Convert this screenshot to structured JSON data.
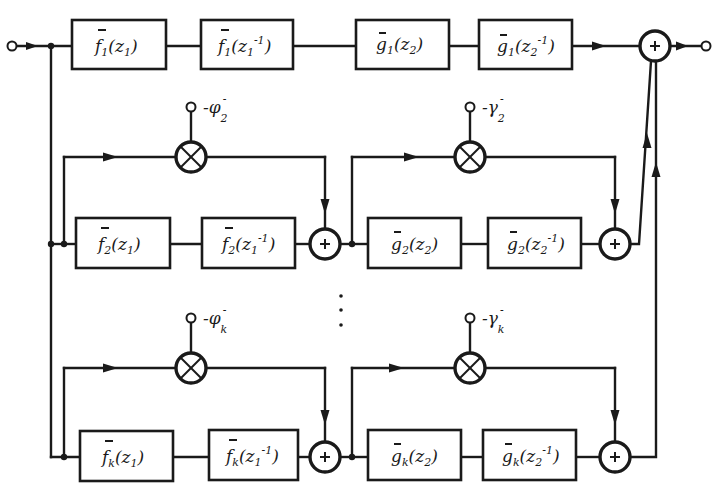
{
  "diagram": {
    "type": "block-diagram",
    "colors": {
      "ink": "#1a1a1a",
      "background": "#ffffff"
    },
    "input": {
      "label": ""
    },
    "output": {
      "label": ""
    },
    "rows": [
      {
        "index": "1",
        "blocks": [
          {
            "fn": "f",
            "sub": "1",
            "arg": "z",
            "arg_sub": "1",
            "exp": ""
          },
          {
            "fn": "f",
            "sub": "1",
            "arg": "z",
            "arg_sub": "1",
            "exp": "-1"
          },
          {
            "fn": "g",
            "sub": "1",
            "arg": "z",
            "arg_sub": "2",
            "exp": ""
          },
          {
            "fn": "g",
            "sub": "1",
            "arg": "z",
            "arg_sub": "2",
            "exp": "-1"
          }
        ]
      },
      {
        "index": "2",
        "coef_left": {
          "sign": "-",
          "sym": "φ",
          "sub": "2",
          "sup": "-"
        },
        "coef_right": {
          "sign": "-",
          "sym": "γ",
          "sub": "2",
          "sup": "-"
        },
        "blocks": [
          {
            "fn": "f",
            "sub": "2",
            "arg": "z",
            "arg_sub": "1",
            "exp": ""
          },
          {
            "fn": "f",
            "sub": "2",
            "arg": "z",
            "arg_sub": "1",
            "exp": "-1"
          },
          {
            "fn": "g",
            "sub": "2",
            "arg": "z",
            "arg_sub": "2",
            "exp": ""
          },
          {
            "fn": "g",
            "sub": "2",
            "arg": "z",
            "arg_sub": "2",
            "exp": "-1"
          }
        ]
      },
      {
        "index": "k",
        "coef_left": {
          "sign": "-",
          "sym": "φ",
          "sub": "k",
          "sup": "-"
        },
        "coef_right": {
          "sign": "-",
          "sym": "γ",
          "sub": "k",
          "sup": "-"
        },
        "blocks": [
          {
            "fn": "f",
            "sub": "k",
            "arg": "z",
            "arg_sub": "1",
            "exp": ""
          },
          {
            "fn": "f",
            "sub": "k",
            "arg": "z",
            "arg_sub": "1",
            "exp": "-1"
          },
          {
            "fn": "g",
            "sub": "k",
            "arg": "z",
            "arg_sub": "2",
            "exp": ""
          },
          {
            "fn": "g",
            "sub": "k",
            "arg": "z",
            "arg_sub": "2",
            "exp": "-1"
          }
        ]
      }
    ],
    "symbols": {
      "adder": "+",
      "multiplier": "×",
      "ellipsis": "⋮",
      "bar": "¯"
    }
  }
}
